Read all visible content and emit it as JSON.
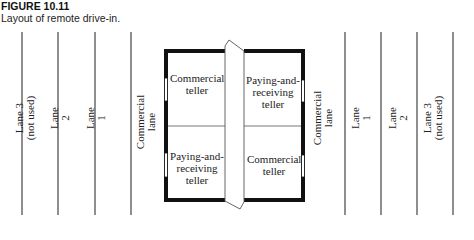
{
  "figure": {
    "number": "FIGURE 10.11",
    "caption": "Layout of remote drive-in."
  },
  "left_lanes": [
    {
      "line1": "Lane 3",
      "line2": "(not used)"
    },
    {
      "line1": "Lane",
      "line2": "2"
    },
    {
      "line1": "Lane",
      "line2": "1"
    },
    {
      "line1": "Commercial",
      "line2": "lane"
    }
  ],
  "right_lanes": [
    {
      "line1": "Commercial",
      "line2": "lane"
    },
    {
      "line1": "Lane",
      "line2": "1"
    },
    {
      "line1": "Lane",
      "line2": "2"
    },
    {
      "line1": "Lane 3",
      "line2": "(not used)"
    }
  ],
  "rooms": {
    "top_left": "Commercial teller",
    "top_right": "Paying-and-receiving teller",
    "bottom_left": "Paying-and-receiving teller",
    "bottom_right": "Commercial teller"
  }
}
